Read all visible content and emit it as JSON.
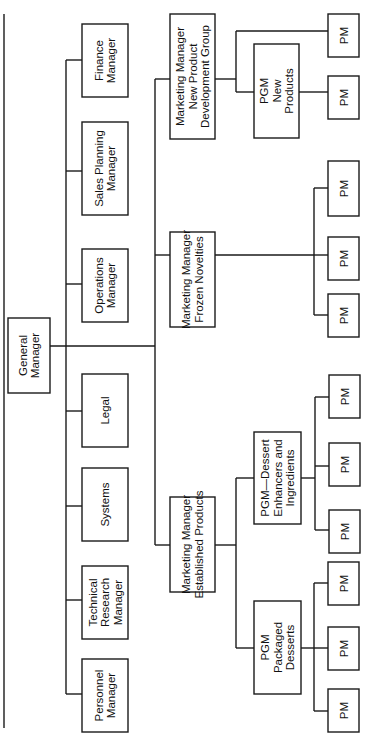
{
  "diagram": {
    "type": "org-chart",
    "orientation": "rotated-90-ccw",
    "colors": {
      "line": "#1a1a1a",
      "box_fill": "#ffffff",
      "text": "#111111",
      "background": "#ffffff"
    },
    "root": {
      "id": "general-manager",
      "lines": [
        "General",
        "Manager"
      ],
      "box": {
        "x": 8,
        "y": 318,
        "w": 42,
        "h": 75
      }
    },
    "staff_trunk_x": 66,
    "staff": [
      {
        "id": "finance-manager",
        "lines": [
          "Finance",
          "Manager"
        ],
        "box": {
          "x": 82,
          "y": 24,
          "w": 46,
          "h": 73
        },
        "connect_y": 60
      },
      {
        "id": "sales-planning-manager",
        "lines": [
          "Sales Planning",
          "Manager"
        ],
        "box": {
          "x": 82,
          "y": 122,
          "w": 46,
          "h": 93
        },
        "connect_y": 171
      },
      {
        "id": "operations-manager",
        "lines": [
          "Operations",
          "Manager"
        ],
        "box": {
          "x": 82,
          "y": 249,
          "w": 46,
          "h": 73
        },
        "connect_y": 284
      },
      {
        "id": "legal",
        "lines": [
          "Legal"
        ],
        "box": {
          "x": 82,
          "y": 374,
          "w": 46,
          "h": 73
        },
        "connect_y": 411
      },
      {
        "id": "systems",
        "lines": [
          "Systems"
        ],
        "box": {
          "x": 82,
          "y": 468,
          "w": 46,
          "h": 73
        },
        "connect_y": 506
      },
      {
        "id": "technical-research-manager",
        "lines": [
          "Technical",
          "Research",
          "Manager"
        ],
        "box": {
          "x": 82,
          "y": 566,
          "w": 46,
          "h": 73
        },
        "connect_y": 600
      },
      {
        "id": "personnel-manager",
        "lines": [
          "Personnel",
          "Manager"
        ],
        "box": {
          "x": 82,
          "y": 659,
          "w": 46,
          "h": 73
        },
        "connect_y": 694
      }
    ],
    "marketing_trunk_x": 155,
    "root_connect_y": 346,
    "marketing": [
      {
        "id": "mm-new-product-development",
        "lines": [
          "Marketing Manager",
          "New Product",
          "Development Group"
        ],
        "box": {
          "x": 170,
          "y": 14,
          "w": 45,
          "h": 125
        },
        "connect_y": 79,
        "sub_trunk_x": 236,
        "pgms": [
          {
            "id": "pgm-new-products",
            "lines": [
              "PGM",
              "New",
              "Products"
            ],
            "box": {
              "x": 254,
              "y": 44,
              "w": 45,
              "h": 94
            },
            "connect_y": 92,
            "pm_trunk_x": 312,
            "pms": [
              {
                "label": "PM",
                "box": {
                  "x": 328,
                  "y": 76,
                  "w": 31,
                  "h": 43
                },
                "connect_y": 92
              }
            ]
          }
        ],
        "direct_pms": [
          {
            "label": "PM",
            "box": {
              "x": 328,
              "y": 14,
              "w": 31,
              "h": 43
            },
            "connect_y": 31
          }
        ]
      },
      {
        "id": "mm-frozen-novelties",
        "lines": [
          "Marketing Manager",
          "Frozen Novelties"
        ],
        "box": {
          "x": 170,
          "y": 232,
          "w": 45,
          "h": 95
        },
        "connect_y": 255,
        "sub_trunk_x": 314,
        "pgms": [],
        "direct_pms": [
          {
            "label": "PM",
            "box": {
              "x": 328,
              "y": 161,
              "w": 31,
              "h": 55
            },
            "connect_y": 188
          },
          {
            "label": "PM",
            "box": {
              "x": 328,
              "y": 237,
              "w": 31,
              "h": 43
            },
            "connect_y": 255
          },
          {
            "label": "PM",
            "box": {
              "x": 328,
              "y": 294,
              "w": 31,
              "h": 43
            },
            "connect_y": 315
          }
        ]
      },
      {
        "id": "mm-established-products",
        "lines": [
          "Marketing Manager",
          "Established Products"
        ],
        "box": {
          "x": 170,
          "y": 497,
          "w": 45,
          "h": 95
        },
        "connect_y": 545,
        "sub_trunk_x": 236,
        "pgms": [
          {
            "id": "pgm-dessert-enhancers",
            "lines": [
              "PGM—Dessert",
              "Enhancers and",
              "Ingredients"
            ],
            "box": {
              "x": 254,
              "y": 432,
              "w": 47,
              "h": 92
            },
            "connect_y": 478,
            "pm_trunk_x": 315,
            "pms": [
              {
                "label": "PM",
                "box": {
                  "x": 329,
                  "y": 375,
                  "w": 31,
                  "h": 43
                },
                "connect_y": 397
              },
              {
                "label": "PM",
                "box": {
                  "x": 329,
                  "y": 443,
                  "w": 31,
                  "h": 43
                },
                "connect_y": 466
              },
              {
                "label": "PM",
                "box": {
                  "x": 329,
                  "y": 510,
                  "w": 31,
                  "h": 43
                },
                "connect_y": 530
              }
            ]
          },
          {
            "id": "pgm-packaged-desserts",
            "lines": [
              "PGM",
              "Packaged",
              "Desserts"
            ],
            "box": {
              "x": 254,
              "y": 601,
              "w": 47,
              "h": 93
            },
            "connect_y": 648,
            "pm_trunk_x": 314,
            "pms": [
              {
                "label": "PM",
                "box": {
                  "x": 328,
                  "y": 562,
                  "w": 31,
                  "h": 43
                },
                "connect_y": 583
              },
              {
                "label": "PM",
                "box": {
                  "x": 328,
                  "y": 627,
                  "w": 31,
                  "h": 43
                },
                "connect_y": 648
              },
              {
                "label": "PM",
                "box": {
                  "x": 328,
                  "y": 689,
                  "w": 31,
                  "h": 43
                },
                "connect_y": 711
              }
            ]
          }
        ],
        "direct_pms": []
      }
    ],
    "border_line": {
      "x": 4,
      "y1": 14,
      "y2": 728
    }
  }
}
